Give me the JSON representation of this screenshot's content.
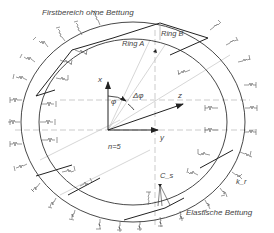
{
  "diagram": {
    "type": "tunnel ring bedding model",
    "labels": {
      "top_region": "Firstbereich ohne Bettung",
      "ring_a": "Ring A",
      "ring_b": "Ring B",
      "axis_x": "x",
      "axis_y": "y",
      "axis_z": "z",
      "angle_phi": "φ",
      "angle_delta_phi": "Δφ",
      "segments": "n=5",
      "spring_cs": "C_s",
      "spring_kr": "k_r",
      "bedding": "Elastische Bettung"
    },
    "colors": {
      "line": "#333333",
      "dash": "#999999",
      "text": "#444444"
    }
  }
}
